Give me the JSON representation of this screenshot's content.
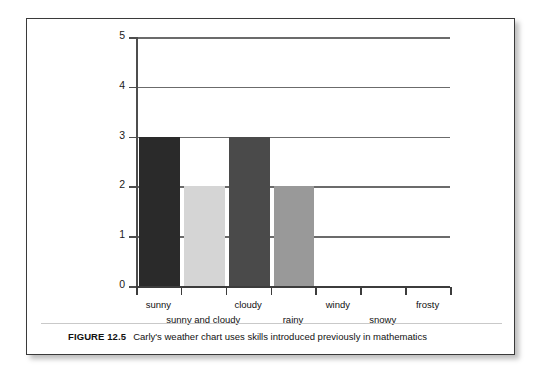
{
  "figure": {
    "caption_number": "FIGURE 12.5",
    "caption_text": "Carly's weather chart uses skills introduced previously in mathematics"
  },
  "chart_data": {
    "type": "bar",
    "title": "",
    "xlabel": "",
    "ylabel": "",
    "categories": [
      "sunny",
      "sunny and cloudy",
      "cloudy",
      "rainy",
      "windy",
      "snowy",
      "frosty"
    ],
    "values": [
      3,
      2,
      3,
      2,
      0,
      0,
      0
    ],
    "bar_colors": [
      "#2a2a2a",
      "#d5d5d5",
      "#4a4a4a",
      "#999999",
      "#ffffff",
      "#ffffff",
      "#ffffff"
    ],
    "ylim": [
      0,
      5
    ],
    "y_ticks": [
      "0",
      "1",
      "2",
      "3",
      "4",
      "5"
    ],
    "grid": true,
    "grid_axis": "y",
    "legend": false,
    "legend_position": "none",
    "axis_color": "#3c3c3c",
    "grid_color": "#6b6b6b",
    "background": "#ffffff"
  }
}
